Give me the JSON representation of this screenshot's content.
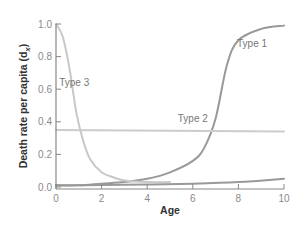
{
  "chart_data": {
    "type": "line",
    "title": "",
    "xlabel": "Age",
    "ylabel": "Death rate per capita (d",
    "ylabel_sub": "x",
    "ylabel_close": ")",
    "xlim": [
      0,
      10
    ],
    "ylim": [
      0,
      1.0
    ],
    "x_ticks": [
      "0",
      "2",
      "4",
      "6",
      "8",
      "10"
    ],
    "y_ticks": [
      "0.0",
      "0.2",
      "0.4",
      "0.6",
      "0.8",
      "1.0"
    ],
    "grid": false,
    "legend": "none (inline curve labels)",
    "series": [
      {
        "name": "Type 1",
        "color": "#999999",
        "x": [
          0,
          1,
          2,
          3,
          4,
          5,
          6,
          6.5,
          7,
          7.5,
          8,
          9,
          10
        ],
        "y": [
          0.01,
          0.01,
          0.02,
          0.03,
          0.05,
          0.09,
          0.16,
          0.24,
          0.42,
          0.75,
          0.9,
          0.97,
          0.99
        ]
      },
      {
        "name": "Type 2",
        "color": "#cccccc",
        "x": [
          0,
          10
        ],
        "y": [
          0.35,
          0.34
        ]
      },
      {
        "name": "Type 3",
        "color": "#c8c8c8",
        "x": [
          0,
          0.3,
          0.6,
          0.9,
          1.2,
          1.5,
          2,
          2.5,
          3,
          4,
          5
        ],
        "y": [
          1.0,
          0.92,
          0.72,
          0.45,
          0.28,
          0.17,
          0.09,
          0.06,
          0.04,
          0.03,
          0.03
        ]
      },
      {
        "name": "baseline",
        "color": "#999999",
        "x": [
          0,
          2,
          4,
          6,
          8,
          10
        ],
        "y": [
          0.01,
          0.012,
          0.015,
          0.02,
          0.03,
          0.05
        ]
      }
    ],
    "annotations": [
      {
        "text": "Type 1",
        "x": 8.6,
        "y": 0.86
      },
      {
        "text": "Type 2",
        "x": 6.0,
        "y": 0.4
      },
      {
        "text": "Type 3",
        "x": 0.8,
        "y": 0.62
      }
    ]
  }
}
